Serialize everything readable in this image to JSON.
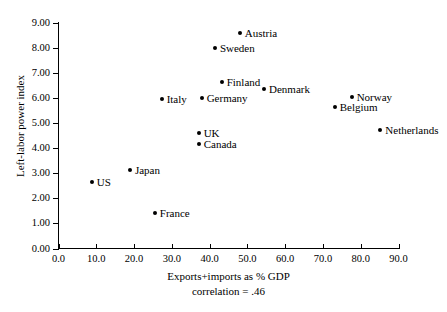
{
  "chart_data": {
    "type": "scatter",
    "title": "",
    "xlabel": "Exports+imports as % GDP",
    "annotation": "correlation = .46",
    "ylabel": "Left-labor power index",
    "xlim": [
      0.0,
      90.0
    ],
    "ylim": [
      0.0,
      9.0
    ],
    "grid": false,
    "legend": "none",
    "xticks": [
      "0.0",
      "10.0",
      "20.0",
      "30.0",
      "40.0",
      "50.0",
      "60.0",
      "70.0",
      "80.0",
      "90.0"
    ],
    "xtick_values": [
      0,
      10,
      20,
      30,
      40,
      50,
      60,
      70,
      80,
      90
    ],
    "yticks": [
      "0.00",
      "1.00",
      "2.00",
      "3.00",
      "4.00",
      "5.00",
      "6.00",
      "7.00",
      "8.00",
      "9.00"
    ],
    "ytick_values": [
      0,
      1,
      2,
      3,
      4,
      5,
      6,
      7,
      8,
      9
    ],
    "points": [
      {
        "label": "US",
        "x": 8.8,
        "y": 2.63,
        "label_side": "right"
      },
      {
        "label": "Japan",
        "x": 18.9,
        "y": 3.11,
        "label_side": "right"
      },
      {
        "label": "France",
        "x": 25.5,
        "y": 1.43,
        "label_side": "right"
      },
      {
        "label": "Italy",
        "x": 27.3,
        "y": 5.94,
        "label_side": "right"
      },
      {
        "label": "Canada",
        "x": 37.1,
        "y": 4.18,
        "label_side": "right"
      },
      {
        "label": "UK",
        "x": 37.1,
        "y": 4.58,
        "label_side": "right"
      },
      {
        "label": "Germany",
        "x": 37.9,
        "y": 5.98,
        "label_side": "right"
      },
      {
        "label": "Sweden",
        "x": 41.4,
        "y": 7.97,
        "label_side": "right"
      },
      {
        "label": "Finland",
        "x": 43.2,
        "y": 6.65,
        "label_side": "right"
      },
      {
        "label": "Austria",
        "x": 48.0,
        "y": 8.57,
        "label_side": "right"
      },
      {
        "label": "Denmark",
        "x": 54.4,
        "y": 6.37,
        "label_side": "right"
      },
      {
        "label": "Belgium",
        "x": 73.1,
        "y": 5.62,
        "label_side": "right"
      },
      {
        "label": "Norway",
        "x": 77.6,
        "y": 6.02,
        "label_side": "right"
      },
      {
        "label": "Netherlands",
        "x": 85.2,
        "y": 4.7,
        "label_side": "right"
      }
    ],
    "marker_color": "#000000",
    "axis_color": "#000000"
  }
}
